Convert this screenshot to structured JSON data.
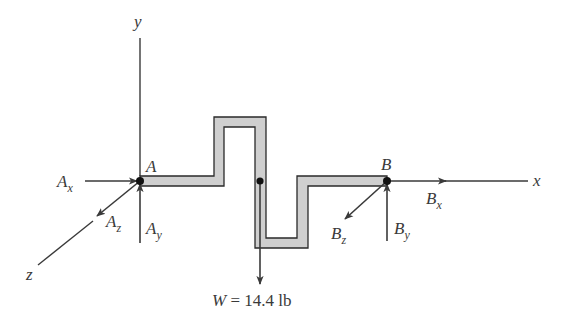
{
  "figure": {
    "type": "free-body diagram",
    "colors": {
      "line": "#3a3a3a",
      "rod_fill": "#cfcfcf",
      "rod_outline": "#2a2a2a",
      "background": "#ffffff"
    },
    "axes": {
      "x": {
        "label": "x"
      },
      "y": {
        "label": "y"
      },
      "z": {
        "label": "z"
      }
    },
    "points": {
      "A": {
        "label": "A"
      },
      "B": {
        "label": "B"
      }
    },
    "reactions": {
      "Ax": {
        "base": "A",
        "sub": "x"
      },
      "Ay": {
        "base": "A",
        "sub": "y"
      },
      "Az": {
        "base": "A",
        "sub": "z"
      },
      "Bx": {
        "base": "B",
        "sub": "x"
      },
      "By": {
        "base": "B",
        "sub": "y"
      },
      "Bz": {
        "base": "B",
        "sub": "z"
      }
    },
    "weight": {
      "symbol": "W",
      "equals": " = ",
      "value": "14.4",
      "unit": " lb"
    }
  }
}
